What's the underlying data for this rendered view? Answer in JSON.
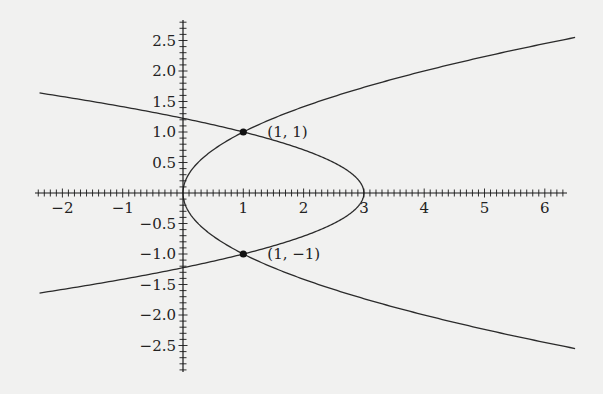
{
  "chart_data": {
    "type": "line",
    "title": "",
    "xlabel": "",
    "ylabel": "",
    "xlim": [
      -2.45,
      6.4
    ],
    "ylim": [
      -2.95,
      2.8
    ],
    "grid": false,
    "legend": null,
    "x_ticks": [
      -2,
      -1,
      1,
      2,
      3,
      4,
      5,
      6
    ],
    "x_tick_labels": [
      "−2",
      "−1",
      "1",
      "2",
      "3",
      "4",
      "5",
      "6"
    ],
    "y_ticks": [
      2.5,
      2.0,
      1.5,
      1.0,
      0.5,
      -0.5,
      -1.0,
      -1.5,
      -2.0,
      -2.5
    ],
    "y_tick_labels": [
      "2.5",
      "2.0",
      "1.5",
      "1.0",
      "0.5",
      "−0.5",
      "−1.0",
      "−1.5",
      "−2.0",
      "−2.5"
    ],
    "minor_tick_step": 0.1,
    "series": [
      {
        "name": "y² = x",
        "description": "right-opening parabola through origin",
        "y_range": [
          -2.55,
          2.55
        ],
        "sample_points": [
          [
            0,
            0
          ],
          [
            1,
            1
          ],
          [
            1,
            -1
          ],
          [
            4,
            2
          ],
          [
            4,
            -2
          ],
          [
            6.5,
            2.55
          ],
          [
            6.5,
            -2.55
          ]
        ]
      },
      {
        "name": "x = 3 − 2y²",
        "description": "left-opening parabola with vertex at (3, 0)",
        "y_range": [
          -1.64,
          1.64
        ],
        "sample_points": [
          [
            3,
            0
          ],
          [
            1,
            1
          ],
          [
            1,
            -1
          ],
          [
            0,
            1.22
          ],
          [
            0,
            -1.22
          ],
          [
            -2.35,
            1.64
          ],
          [
            -2.35,
            -1.64
          ]
        ]
      }
    ],
    "annotations": [
      {
        "x": 1,
        "y": 1,
        "label": "(1, 1)",
        "marker": "filled-circle"
      },
      {
        "x": 1,
        "y": -1,
        "label": "(1, −1)",
        "marker": "filled-circle"
      }
    ]
  },
  "style": {
    "background": "#f1f1f0",
    "curve_color": "#2b2b2b",
    "axis_color": "#1a1a1a"
  },
  "layout": {
    "origin_px": [
      183,
      193
    ],
    "px_per_unit_x": 60.3,
    "px_per_unit_y": 61,
    "x_axis_px": [
      35,
      567
    ],
    "y_axis_px": [
      20,
      372
    ]
  }
}
